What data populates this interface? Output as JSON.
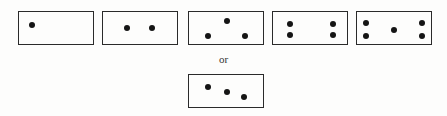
{
  "separator_text": "or",
  "patterns": [
    {
      "name": "one-dot",
      "count": 1
    },
    {
      "name": "two-dots",
      "count": 2
    },
    {
      "name": "three-dots-triangle",
      "count": 3
    },
    {
      "name": "four-dots",
      "count": 4
    },
    {
      "name": "five-dots",
      "count": 5
    },
    {
      "name": "three-dots-diagonal",
      "count": 3
    }
  ]
}
